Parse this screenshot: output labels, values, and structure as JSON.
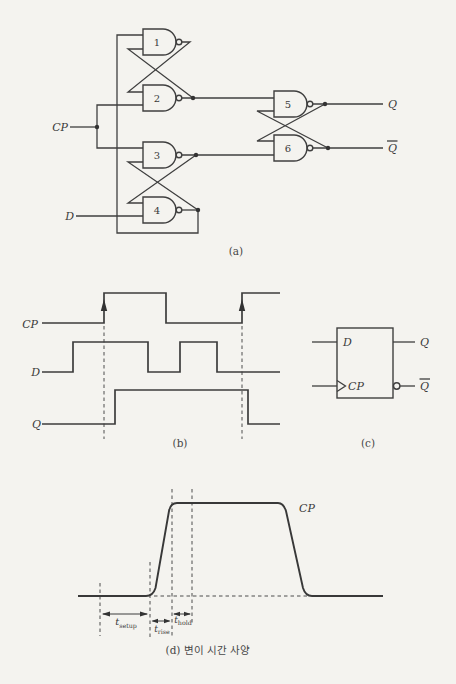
{
  "colors": {
    "paper": "#f4f3ef",
    "ink": "#3f3f3f"
  },
  "circuit": {
    "caption": "(a)",
    "gates": [
      "1",
      "2",
      "3",
      "4",
      "5",
      "6"
    ],
    "cp_label": "CP",
    "d_label": "D",
    "q_label": "Q",
    "q_bar_label": "Q"
  },
  "timing": {
    "caption": "(b)",
    "cp_label": "CP",
    "d_label": "D",
    "q_label": "Q"
  },
  "symbol": {
    "caption": "(c)",
    "d_label": "D",
    "cp_label": "CP",
    "q_label": "Q",
    "q_bar_label": "Q"
  },
  "spec": {
    "caption": "(d) 변이 시간 사양",
    "cp_label": "CP",
    "t_symbol": "t",
    "setup_sub": "setup",
    "rise_sub": "rise",
    "hold_sub": "hold"
  }
}
